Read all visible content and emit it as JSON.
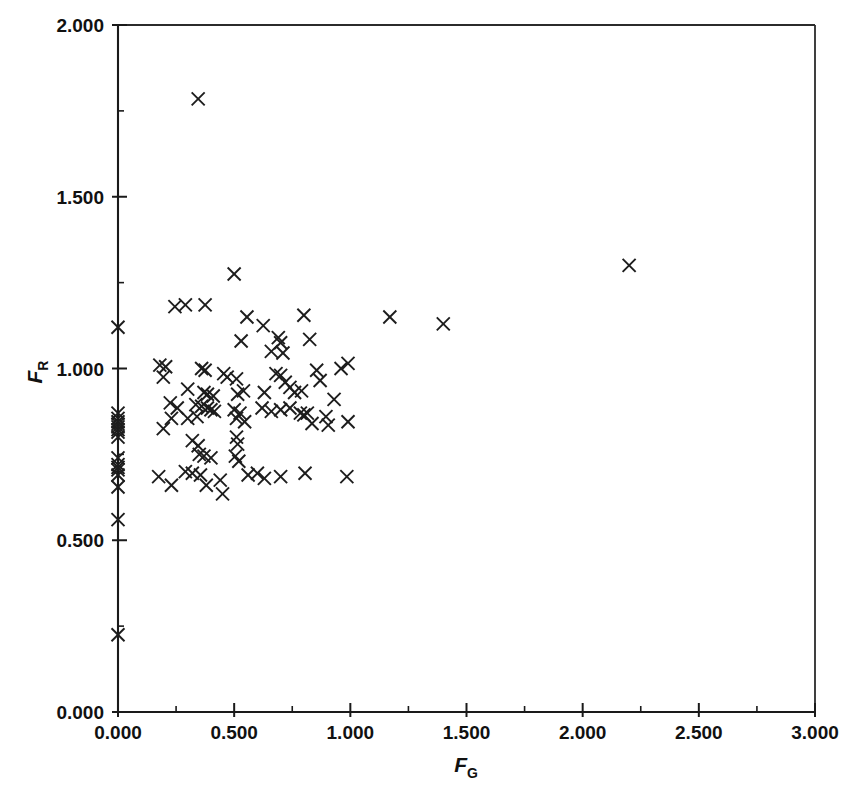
{
  "figure": {
    "background_color": "#ffffff",
    "marker_color": "#1d1d1d",
    "axis_color": "#1a1a1a",
    "marker_symbol": "x",
    "marker_size_px": 13
  },
  "axes": {
    "x": {
      "title_symbol": "F",
      "title_subscript": "G",
      "min": 0.0,
      "max": 3.0,
      "major_step": 0.5,
      "minor_step": 0.25,
      "tick_labels": [
        "0.000",
        "0.500",
        "1.000",
        "1.500",
        "2.000",
        "2.500",
        "3.000"
      ],
      "tick_values": [
        0.0,
        0.5,
        1.0,
        1.5,
        2.0,
        2.5,
        3.0
      ],
      "pixel_origin": 118,
      "pixel_end": 815
    },
    "y": {
      "title_symbol": "F",
      "title_subscript": "R",
      "min": 0.0,
      "max": 2.0,
      "major_step": 0.5,
      "minor_step": 0.25,
      "tick_labels": [
        "0.000",
        "0.500",
        "1.000",
        "1.500",
        "2.000"
      ],
      "tick_values": [
        0.0,
        0.5,
        1.0,
        1.5,
        2.0
      ],
      "pixel_origin": 712,
      "pixel_end": 25
    }
  },
  "chart_data": {
    "type": "scatter",
    "title": "",
    "subtitle": "",
    "xlabel": "F_G",
    "ylabel": "F_R",
    "xlim": [
      0.0,
      3.0
    ],
    "ylim": [
      0.0,
      2.0
    ],
    "grid": false,
    "legend": null,
    "legend_position": "none",
    "marker": "x",
    "series": [
      {
        "name": "samples",
        "points": [
          [
            0.0,
            1.12
          ],
          [
            0.0,
            0.87
          ],
          [
            0.0,
            0.855
          ],
          [
            0.0,
            0.845
          ],
          [
            0.0,
            0.838
          ],
          [
            0.0,
            0.83
          ],
          [
            0.0,
            0.822
          ],
          [
            0.0,
            0.815
          ],
          [
            0.0,
            0.8
          ],
          [
            0.0,
            0.74
          ],
          [
            0.0,
            0.72
          ],
          [
            0.0,
            0.712
          ],
          [
            0.0,
            0.705
          ],
          [
            0.0,
            0.69
          ],
          [
            0.0,
            0.655
          ],
          [
            0.0,
            0.56
          ],
          [
            0.0,
            0.225
          ],
          [
            0.345,
            1.785
          ],
          [
            0.5,
            1.275
          ],
          [
            0.245,
            1.18
          ],
          [
            0.29,
            1.185
          ],
          [
            0.375,
            1.185
          ],
          [
            0.555,
            1.15
          ],
          [
            0.8,
            1.155
          ],
          [
            0.625,
            1.125
          ],
          [
            1.17,
            1.15
          ],
          [
            1.4,
            1.13
          ],
          [
            2.2,
            1.3
          ],
          [
            0.53,
            1.08
          ],
          [
            0.69,
            1.09
          ],
          [
            0.7,
            1.075
          ],
          [
            0.825,
            1.085
          ],
          [
            0.66,
            1.05
          ],
          [
            0.71,
            1.045
          ],
          [
            0.18,
            1.01
          ],
          [
            0.205,
            1.005
          ],
          [
            0.195,
            0.975
          ],
          [
            0.36,
            1.0
          ],
          [
            0.375,
            0.995
          ],
          [
            0.455,
            0.985
          ],
          [
            0.47,
            0.975
          ],
          [
            0.51,
            0.97
          ],
          [
            0.68,
            0.985
          ],
          [
            0.7,
            0.98
          ],
          [
            0.72,
            0.96
          ],
          [
            0.855,
            0.995
          ],
          [
            0.99,
            1.015
          ],
          [
            0.96,
            1.0
          ],
          [
            0.87,
            0.965
          ],
          [
            0.3,
            0.94
          ],
          [
            0.37,
            0.93
          ],
          [
            0.385,
            0.925
          ],
          [
            0.41,
            0.92
          ],
          [
            0.515,
            0.925
          ],
          [
            0.54,
            0.935
          ],
          [
            0.63,
            0.93
          ],
          [
            0.74,
            0.945
          ],
          [
            0.76,
            0.93
          ],
          [
            0.79,
            0.935
          ],
          [
            0.93,
            0.91
          ],
          [
            0.225,
            0.9
          ],
          [
            0.255,
            0.885
          ],
          [
            0.335,
            0.895
          ],
          [
            0.36,
            0.89
          ],
          [
            0.385,
            0.885
          ],
          [
            0.4,
            0.88
          ],
          [
            0.415,
            0.875
          ],
          [
            0.5,
            0.88
          ],
          [
            0.525,
            0.87
          ],
          [
            0.62,
            0.885
          ],
          [
            0.66,
            0.875
          ],
          [
            0.7,
            0.88
          ],
          [
            0.74,
            0.885
          ],
          [
            0.785,
            0.87
          ],
          [
            0.8,
            0.865
          ],
          [
            0.815,
            0.87
          ],
          [
            0.195,
            0.825
          ],
          [
            0.23,
            0.855
          ],
          [
            0.3,
            0.855
          ],
          [
            0.34,
            0.86
          ],
          [
            0.51,
            0.855
          ],
          [
            0.545,
            0.845
          ],
          [
            0.835,
            0.84
          ],
          [
            0.895,
            0.86
          ],
          [
            0.905,
            0.835
          ],
          [
            0.99,
            0.845
          ],
          [
            0.32,
            0.79
          ],
          [
            0.345,
            0.775
          ],
          [
            0.51,
            0.8
          ],
          [
            0.515,
            0.78
          ],
          [
            0.35,
            0.75
          ],
          [
            0.37,
            0.745
          ],
          [
            0.4,
            0.74
          ],
          [
            0.505,
            0.745
          ],
          [
            0.52,
            0.73
          ],
          [
            0.175,
            0.685
          ],
          [
            0.23,
            0.66
          ],
          [
            0.29,
            0.7
          ],
          [
            0.32,
            0.695
          ],
          [
            0.355,
            0.69
          ],
          [
            0.38,
            0.66
          ],
          [
            0.44,
            0.675
          ],
          [
            0.45,
            0.635
          ],
          [
            0.56,
            0.69
          ],
          [
            0.6,
            0.695
          ],
          [
            0.63,
            0.68
          ],
          [
            0.7,
            0.685
          ],
          [
            0.805,
            0.695
          ],
          [
            0.985,
            0.685
          ]
        ]
      }
    ]
  }
}
